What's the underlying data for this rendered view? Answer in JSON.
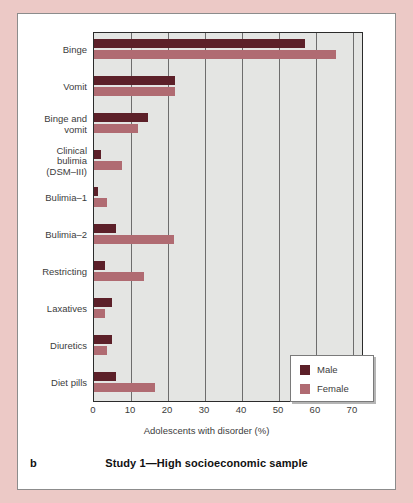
{
  "figure": {
    "panel_letter": "b",
    "caption": "Study 1—High socioeconomic sample"
  },
  "legend": {
    "position": "bottom-right-inside",
    "entries": [
      {
        "label": "Male",
        "color": "#5c2029"
      },
      {
        "label": "Female",
        "color": "#b06b72"
      }
    ]
  },
  "colors": {
    "male": "#5c2029",
    "female": "#b06b72",
    "plot_background": "#e4e5e3",
    "page_background": "#ecc9c6",
    "panel_background": "#ffffff",
    "axis": "#2b2b2b",
    "gridline": "#6d6d6d"
  },
  "chart_data": {
    "type": "bar",
    "orientation": "horizontal",
    "title": "Study 1—High socioeconomic sample",
    "subtitle": "",
    "xlabel": "Adolescents with disorder (%)",
    "ylabel": "",
    "xlim": [
      0,
      73
    ],
    "xticks": [
      0,
      10,
      20,
      30,
      40,
      50,
      60,
      70
    ],
    "xticklabels": [
      "0",
      "10",
      "20",
      "30",
      "40",
      "50",
      "60",
      "70"
    ],
    "grid": "vertical",
    "legend_position": "lower right",
    "categories": [
      "Binge",
      "Vomit",
      "Binge and vomit",
      "Clinical bulimia (DSM–III)",
      "Bulimia–1",
      "Bulimia–2",
      "Restricting",
      "Laxatives",
      "Diuretics",
      "Diet pills"
    ],
    "category_labels": [
      [
        "Binge"
      ],
      [
        "Vomit"
      ],
      [
        "Binge and",
        "vomit"
      ],
      [
        "Clinical",
        "bulimia",
        "(DSM–III)"
      ],
      [
        "Bulimia–1"
      ],
      [
        "Bulimia–2"
      ],
      [
        "Restricting"
      ],
      [
        "Laxatives"
      ],
      [
        "Diuretics"
      ],
      [
        "Diet pills"
      ]
    ],
    "series": [
      {
        "name": "Male",
        "color": "#5c2029",
        "values": [
          57,
          22,
          14.5,
          2,
          1,
          6,
          3,
          5,
          5,
          6
        ]
      },
      {
        "name": "Female",
        "color": "#b06b72",
        "values": [
          65.5,
          22,
          12,
          7.5,
          3.5,
          21.5,
          13.5,
          3,
          3.5,
          16.5
        ]
      }
    ]
  }
}
